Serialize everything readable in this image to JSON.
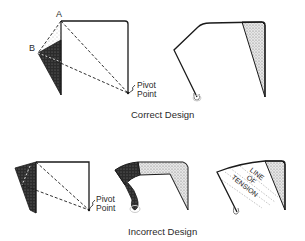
{
  "diagram": {
    "top_row": {
      "caption": "Correct Design",
      "left_figure": {
        "label_a": "A",
        "label_b": "B",
        "pivot_line1": "Pivot",
        "pivot_line2": "Point"
      }
    },
    "bottom_row": {
      "caption": "Incorrect Design",
      "left_figure": {
        "pivot_line1": "Pivot",
        "pivot_line2": "Point"
      },
      "right_figure": {
        "tension_line1": "LINE",
        "tension_line2": "OF",
        "tension_line3": "TENSION"
      }
    }
  },
  "colors": {
    "stroke": "#1a1a1a",
    "dark_fill": "#2b2b2b",
    "stipple_fill": "#d9d9d9",
    "background": "#ffffff"
  }
}
